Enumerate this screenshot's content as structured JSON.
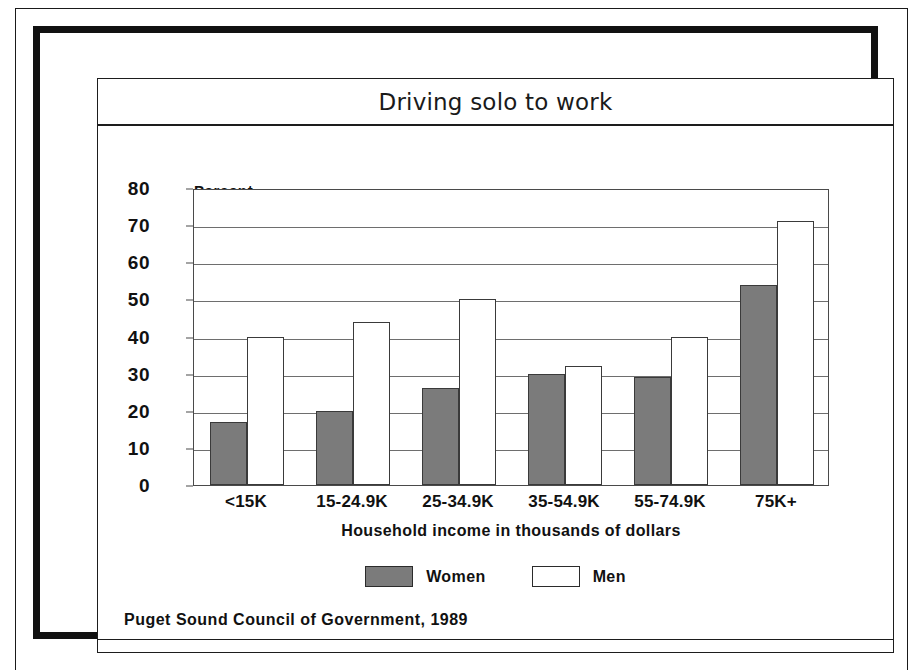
{
  "chart_data": {
    "type": "bar",
    "title": "Driving solo to work",
    "xlabel": "Household income in thousands of dollars",
    "ylabel": "Percent",
    "ylim": [
      0,
      80
    ],
    "yticks": [
      0,
      10,
      20,
      30,
      40,
      50,
      60,
      70,
      80
    ],
    "grid": true,
    "legend_position": "bottom-center",
    "categories": [
      "<15K",
      "15-24.9K",
      "25-34.9K",
      "35-54.9K",
      "55-74.9K",
      "75K+"
    ],
    "series": [
      {
        "name": "Women",
        "color": "#7b7b7b",
        "values": [
          17,
          20,
          26,
          30,
          29,
          54
        ]
      },
      {
        "name": "Men",
        "color": "#ffffff",
        "values": [
          40,
          44,
          50,
          32,
          40,
          71
        ]
      }
    ],
    "source": "Puget Sound Council of Government, 1989"
  },
  "legend": {
    "items": [
      {
        "label": "Women",
        "swatch": "women"
      },
      {
        "label": "Men",
        "swatch": "men"
      }
    ]
  }
}
